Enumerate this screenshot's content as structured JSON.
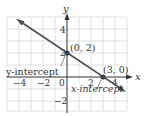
{
  "diagram": {
    "type": "coordinate-graph",
    "axes": {
      "x_label": "x",
      "y_label": "y",
      "x_ticks": [
        {
          "value": -4,
          "label": "−4"
        },
        {
          "value": -2,
          "label": "−2"
        },
        {
          "value": 0,
          "label": "0"
        },
        {
          "value": 2,
          "label": "2"
        },
        {
          "value": 4,
          "label": "4"
        }
      ],
      "y_ticks": [
        {
          "value": 4,
          "label": "4"
        },
        {
          "value": 2,
          "label": "2"
        },
        {
          "value": -2,
          "label": "−2"
        }
      ],
      "grid": true,
      "x_range": [
        -5,
        5
      ],
      "y_range": [
        -3,
        5
      ]
    },
    "line": {
      "equation": "y = -2/3 x + 2",
      "color": "#444a55",
      "arrows": "both"
    },
    "points": [
      {
        "coords": "(0, 2)",
        "x": 0,
        "y": 2,
        "annotation": "y-intercept"
      },
      {
        "coords": "(3, 0)",
        "x": 3,
        "y": 0,
        "annotation": "x-intercept"
      }
    ],
    "labels": {
      "point_a": "(0, 2)",
      "point_b": "(3, 0)",
      "y_intercept": "y-intercept",
      "x_intercept": "x-intercept"
    },
    "colors": {
      "grid": "#d4d4d4",
      "axis": "#333333",
      "line": "#444a55",
      "point": "#3a3f48"
    }
  }
}
